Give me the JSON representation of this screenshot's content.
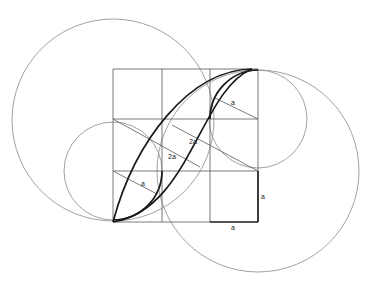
{
  "diagram": {
    "type": "geometric-construction",
    "grid": {
      "columns": 3,
      "rows": 3,
      "cell_unit": "a"
    },
    "labels": {
      "top_right_radius": "a",
      "center_upper_segment": "2a",
      "center_lower_segment": "2a",
      "bottom_left_radius": "a",
      "right_side": "a",
      "bottom_side": "a"
    },
    "colors": {
      "background": "#ffffff",
      "thin_line": "#8a8a8a",
      "grid_line": "#6a6a6a",
      "bold_line": "#1a1a1a"
    }
  }
}
